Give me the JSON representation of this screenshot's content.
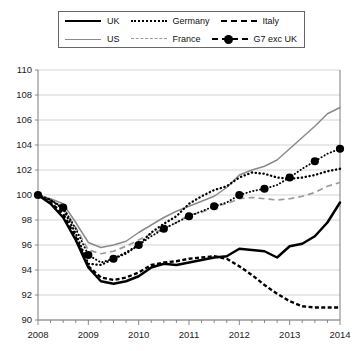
{
  "legend": {
    "rows": [
      [
        {
          "key": "uk",
          "label": "UK"
        },
        {
          "key": "de",
          "label": "Germany"
        },
        {
          "key": "it",
          "label": "Italy"
        }
      ],
      [
        {
          "key": "us",
          "label": "US"
        },
        {
          "key": "fr",
          "label": "France"
        },
        {
          "key": "g7",
          "label": "G7 exc UK"
        }
      ]
    ]
  },
  "chart_data": {
    "type": "line",
    "title": "",
    "subtitle": "",
    "xlabel": "",
    "ylabel": "",
    "xlim": [
      2008,
      2014
    ],
    "ylim": [
      90,
      110
    ],
    "ytick_step": 2,
    "yticks": [
      90,
      92,
      94,
      96,
      98,
      100,
      102,
      104,
      106,
      108,
      110
    ],
    "xticks": [
      2008,
      2009,
      2010,
      2011,
      2012,
      2013,
      2014
    ],
    "xminor_per_year": 4,
    "grid": "horizontal",
    "legend_position": "top",
    "index_base": 100,
    "x": [
      2008.0,
      2008.25,
      2008.5,
      2008.75,
      2009.0,
      2009.25,
      2009.5,
      2009.75,
      2010.0,
      2010.25,
      2010.5,
      2010.75,
      2011.0,
      2011.25,
      2011.5,
      2011.75,
      2012.0,
      2012.25,
      2012.5,
      2012.75,
      2013.0,
      2013.25,
      2013.5,
      2013.75,
      2014.0
    ],
    "series": [
      {
        "name": "UK",
        "color": "#000000",
        "style": "solid-thick",
        "values": [
          100.0,
          99.3,
          98.2,
          96.4,
          94.2,
          93.1,
          92.9,
          93.1,
          93.5,
          94.2,
          94.5,
          94.4,
          94.6,
          94.8,
          95.0,
          95.1,
          95.7,
          95.6,
          95.5,
          95.0,
          95.9,
          96.1,
          96.7,
          97.8,
          99.4
        ]
      },
      {
        "name": "US",
        "color": "#8a8a8a",
        "style": "solid-thin",
        "values": [
          100.0,
          99.7,
          99.3,
          97.8,
          96.2,
          95.8,
          96.0,
          96.3,
          97.0,
          97.6,
          98.2,
          98.7,
          99.1,
          99.5,
          99.9,
          100.6,
          101.6,
          102.0,
          102.3,
          102.8,
          103.7,
          104.6,
          105.5,
          106.5,
          107.0
        ]
      },
      {
        "name": "Germany",
        "color": "#000000",
        "style": "dotted",
        "values": [
          100.0,
          99.6,
          98.9,
          96.9,
          94.5,
          94.4,
          94.9,
          95.4,
          96.0,
          97.0,
          97.7,
          98.3,
          99.3,
          99.9,
          100.4,
          100.7,
          101.4,
          101.8,
          101.7,
          101.4,
          101.3,
          101.4,
          101.6,
          101.9,
          102.1
        ]
      },
      {
        "name": "France",
        "color": "#9a9a9a",
        "style": "dashed",
        "values": [
          100.0,
          99.6,
          99.0,
          97.4,
          95.6,
          95.3,
          95.5,
          95.9,
          96.4,
          96.9,
          97.3,
          97.8,
          98.4,
          98.6,
          99.1,
          99.3,
          99.7,
          99.8,
          99.7,
          99.6,
          99.7,
          99.9,
          100.2,
          100.7,
          101.0
        ]
      },
      {
        "name": "Italy",
        "color": "#000000",
        "style": "dashed-dense",
        "values": [
          100.0,
          99.4,
          98.5,
          96.6,
          94.3,
          93.4,
          93.2,
          93.4,
          93.8,
          94.4,
          94.6,
          94.7,
          94.9,
          95.0,
          95.1,
          94.9,
          94.3,
          93.6,
          92.8,
          92.1,
          91.5,
          91.1,
          91.0,
          91.0,
          91.0
        ]
      },
      {
        "name": "G7 exc UK",
        "color": "#000000",
        "style": "dash-dot-marker",
        "values": [
          100.0,
          99.6,
          99.0,
          97.3,
          95.2,
          94.6,
          94.9,
          95.3,
          96.0,
          96.7,
          97.3,
          97.8,
          98.3,
          98.7,
          99.1,
          99.4,
          100.0,
          100.3,
          100.5,
          100.8,
          101.4,
          102.1,
          102.7,
          103.3,
          103.7
        ]
      }
    ]
  }
}
